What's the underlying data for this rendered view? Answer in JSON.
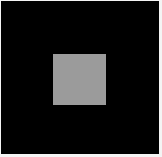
{
  "scene": {
    "background_color": "#000000",
    "border_color": "#f4f4f4",
    "square": {
      "color": "#9b9b9b",
      "x": 53,
      "y": 54,
      "width": 53,
      "height": 51
    }
  }
}
